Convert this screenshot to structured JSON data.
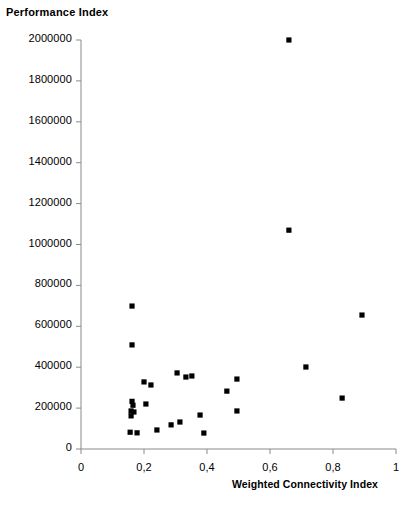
{
  "chart_data": {
    "type": "scatter",
    "title": "",
    "ylabel": "Performance Index",
    "xlabel": "Weighted Connectivity Index",
    "xlim": [
      0,
      1
    ],
    "ylim": [
      0,
      2000000
    ],
    "grid": false,
    "legend": "none",
    "marker": "filled-square-black",
    "marker_color": "#000000",
    "axis_color": "#808080",
    "xticks": [
      0,
      0.2,
      0.4,
      0.6,
      0.8,
      1
    ],
    "xtick_labels": [
      "0",
      "0,2",
      "0,4",
      "0,6",
      "0,8",
      "1"
    ],
    "yticks": [
      0,
      200000,
      400000,
      600000,
      800000,
      1000000,
      1200000,
      1400000,
      1600000,
      1800000,
      2000000
    ],
    "ytick_labels": [
      "0",
      "200000",
      "400000",
      "600000",
      "800000",
      "1000000",
      "1200000",
      "1400000",
      "1600000",
      "1800000",
      "2000000"
    ],
    "points": [
      {
        "x": 0.162,
        "y": 699000
      },
      {
        "x": 0.162,
        "y": 509000
      },
      {
        "x": 0.162,
        "y": 233000
      },
      {
        "x": 0.165,
        "y": 214000
      },
      {
        "x": 0.159,
        "y": 186000
      },
      {
        "x": 0.168,
        "y": 181000
      },
      {
        "x": 0.159,
        "y": 162000
      },
      {
        "x": 0.156,
        "y": 82000
      },
      {
        "x": 0.178,
        "y": 79000
      },
      {
        "x": 0.2,
        "y": 328000
      },
      {
        "x": 0.222,
        "y": 313000
      },
      {
        "x": 0.206,
        "y": 220000
      },
      {
        "x": 0.241,
        "y": 93000
      },
      {
        "x": 0.286,
        "y": 118000
      },
      {
        "x": 0.305,
        "y": 372000
      },
      {
        "x": 0.333,
        "y": 352000
      },
      {
        "x": 0.352,
        "y": 357000
      },
      {
        "x": 0.314,
        "y": 132000
      },
      {
        "x": 0.378,
        "y": 166000
      },
      {
        "x": 0.39,
        "y": 78000
      },
      {
        "x": 0.463,
        "y": 283000
      },
      {
        "x": 0.495,
        "y": 342000
      },
      {
        "x": 0.495,
        "y": 186000
      },
      {
        "x": 0.66,
        "y": 2000000
      },
      {
        "x": 0.66,
        "y": 1070000
      },
      {
        "x": 0.714,
        "y": 401000
      },
      {
        "x": 0.829,
        "y": 249000
      },
      {
        "x": 0.892,
        "y": 655000
      }
    ]
  }
}
